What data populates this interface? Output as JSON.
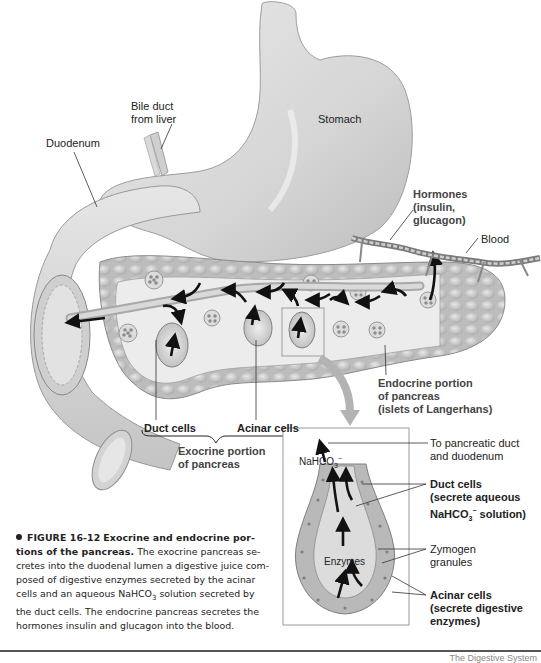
{
  "figure": {
    "number": "FIGURE 16-12",
    "title_part1": "Exocrine and endocrine por-",
    "title_part2": "tions of the pancreas.",
    "caption_body": "The exocrine pancreas secretes into the duodenal lumen a digestive juice composed of digestive enzymes secreted by the acinar cells and an aqueous NaHCO3 solution secreted by the duct cells. The endocrine pancreas secretes the hormones insulin and glucagon into the blood.",
    "caption_lines": [
      "The exocrine pancreas se-",
      "cretes into the duodenal lumen a digestive juice com-",
      "posed of digestive enzymes secreted by the acinar",
      "cells and an aqueous NaHCO",
      "3",
      " solution secreted by",
      "the duct cells. The endocrine pancreas secretes the",
      "hormones insulin and glucagon into the blood."
    ]
  },
  "labels": {
    "bile_duct": [
      "Bile duct",
      "from liver"
    ],
    "duodenum": "Duodenum",
    "stomach": "Stomach",
    "hormones": [
      "Hormones",
      "(insulin,",
      "glucagon)"
    ],
    "blood": "Blood",
    "duct_cells": "Duct cells",
    "acinar_cells": "Acinar cells",
    "exocrine_portion": [
      "Exocrine portion",
      "of pancreas"
    ],
    "endocrine_portion": [
      "Endocrine portion",
      "of pancreas",
      "(islets of Langerhans)"
    ]
  },
  "inset": {
    "nahco3": {
      "base": "NaHCO",
      "sub": "3",
      "sup": "−"
    },
    "enzymes": "Enzymes",
    "to_duct": [
      "To pancreatic duct",
      "and duodenum"
    ],
    "duct_cells": [
      "Duct cells",
      "(secrete aqueous"
    ],
    "duct_cells_line3": {
      "base": "NaHCO",
      "sub": "3",
      "sup": "−",
      "rest": " solution)"
    },
    "zymogen": [
      "Zymogen",
      "granules"
    ],
    "acinar_cells": [
      "Acinar cells",
      "(secrete digestive",
      "enzymes)"
    ]
  },
  "footer": {
    "text": "The Digestive System"
  },
  "colors": {
    "organ_fill": "#d9d9d9",
    "organ_shade": "#b5b5b5",
    "pancreas_fill": "#c8c8c8",
    "lobule": "#e6e6e6",
    "arrow": "#111111",
    "inset_border": "#9a9a9a",
    "pointer_arrow": "#b0b0b0"
  }
}
